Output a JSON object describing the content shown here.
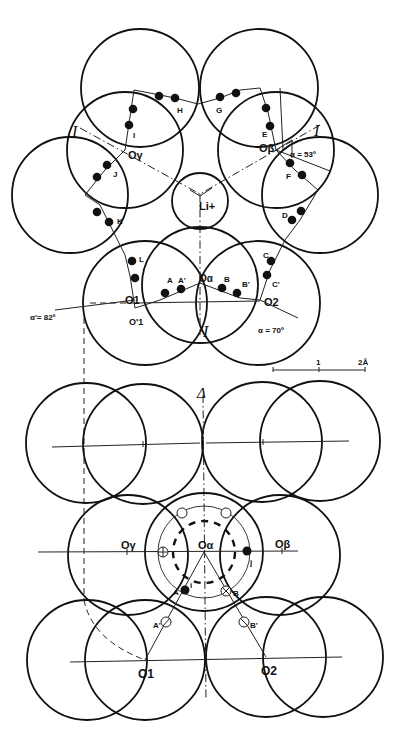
{
  "figure": {
    "top_view": {
      "plane_labels": [
        "I",
        "I",
        "I"
      ],
      "centers": {
        "O_alpha": "Oα",
        "O_beta": "Oβ",
        "O_gamma": "Oγ",
        "O1": "O1",
        "O1_prime": "O'1",
        "O2": "O2"
      },
      "cation": "Li+",
      "atom_labels": [
        "A",
        "A'",
        "B",
        "B'",
        "C",
        "C'",
        "D",
        "E",
        "F",
        "G",
        "H",
        "I",
        "J",
        "K",
        "L"
      ],
      "angles": {
        "alpha_beta": "α = 53º",
        "alpha_left": "α'= 82º",
        "alpha_right": "α = 70º"
      },
      "scale_bar": {
        "tick_1": "1",
        "tick_2": "2Å"
      }
    },
    "bottom_view": {
      "axis_label": "Δ",
      "centers": {
        "O_alpha": "Oα",
        "O_beta": "Oβ",
        "O_gamma": "Oγ",
        "O1": "O1",
        "O2": "O2"
      },
      "atom_labels": [
        "A",
        "A'",
        "B",
        "B'",
        "i",
        "j"
      ]
    }
  }
}
